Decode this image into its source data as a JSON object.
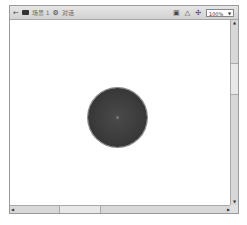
{
  "toolbar": {
    "back_icon": "back-arrow-icon",
    "scene_icon": "scene-icon",
    "scene_label": "场景 1",
    "symbol_icon": "symbol-icon",
    "symbol_label": "对话",
    "edit_scene_icon": "edit-scene-icon",
    "edit_symbol_icon": "edit-symbols-icon",
    "center_icon": "center-stage-icon",
    "zoom_value": "100%"
  },
  "stage": {
    "shape": "circle",
    "fill_color": "#3a3a3a",
    "stroke_color": "#888888"
  }
}
